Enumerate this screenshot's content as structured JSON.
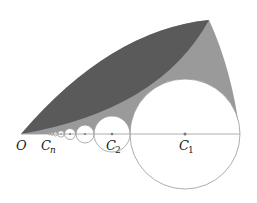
{
  "figure": {
    "type": "geometry-diagram",
    "colors": {
      "dark_region": "#5a5a5a",
      "light_region": "#9a9a9a",
      "circle_stroke": "#999999",
      "baseline": "#999999",
      "center_dot": "#777777"
    },
    "labels": {
      "origin": "O",
      "cn_main": "C",
      "cn_sub": "n",
      "c2_main": "C",
      "c2_sub": "2",
      "c1_main": "C",
      "c1_sub": "1"
    }
  }
}
